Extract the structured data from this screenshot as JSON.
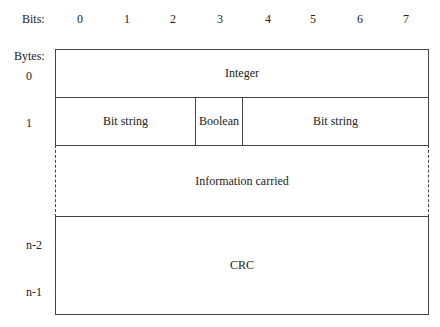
{
  "header": {
    "bits_label": "Bits:",
    "bytes_label": "Bytes:"
  },
  "bits": [
    "0",
    "1",
    "2",
    "3",
    "4",
    "5",
    "6",
    "7"
  ],
  "bytes": {
    "b0": "0",
    "b1": "1",
    "bn2": "n-2",
    "bn1": "n-1"
  },
  "fields": {
    "integer": "Integer",
    "bit_string_left": "Bit string",
    "boolean": "Boolean",
    "bit_string_right": "Bit string",
    "information": "Information carried",
    "crc": "CRC"
  }
}
